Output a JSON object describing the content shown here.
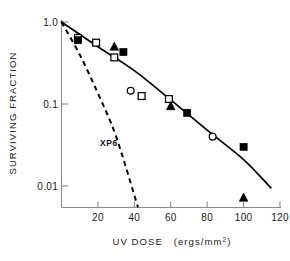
{
  "chart_data": {
    "type": "scatter",
    "title": "",
    "subtitle": "",
    "xlabel": "UV DOSE (ergs/mm2)",
    "xlabel_main": "UV DOSE",
    "xlabel_units_pre": "(ergs/mm",
    "xlabel_units_sup": "2",
    "xlabel_units_post": ")",
    "ylabel": "SURVIVING FRACTION",
    "xlim": [
      0,
      125
    ],
    "ylim": [
      0.005,
      1.0
    ],
    "yscale": "log",
    "xscale": "linear",
    "grid": false,
    "legend": "none",
    "xticks": [
      20,
      40,
      60,
      80,
      100,
      120
    ],
    "xticklabels": [
      "20",
      "40",
      "60",
      "80",
      "100",
      "120"
    ],
    "yticks": [
      1.0,
      0.1,
      0.01
    ],
    "yticklabels": [
      "1.0",
      "0.1",
      "0.01"
    ],
    "annotations": [
      {
        "text": "XP6",
        "x": 26,
        "y": 0.031,
        "note": "label for dashed XP6 survival curve"
      }
    ],
    "series": [
      {
        "name": "open-square",
        "marker": "open square",
        "points": [
          {
            "x": 9,
            "y": 0.64
          },
          {
            "x": 19,
            "y": 0.56
          },
          {
            "x": 29,
            "y": 0.37
          },
          {
            "x": 44,
            "y": 0.125
          },
          {
            "x": 59,
            "y": 0.115
          }
        ]
      },
      {
        "name": "filled-square",
        "marker": "filled square",
        "points": [
          {
            "x": 9,
            "y": 0.6
          },
          {
            "x": 34,
            "y": 0.43
          },
          {
            "x": 69,
            "y": 0.078
          },
          {
            "x": 100,
            "y": 0.03
          }
        ]
      },
      {
        "name": "filled-triangle",
        "marker": "filled triangle",
        "points": [
          {
            "x": 29,
            "y": 0.5
          },
          {
            "x": 60,
            "y": 0.094
          },
          {
            "x": 100,
            "y": 0.0072
          }
        ]
      },
      {
        "name": "open-circle",
        "marker": "open circle",
        "points": [
          {
            "x": 38,
            "y": 0.145
          },
          {
            "x": 83,
            "y": 0.04
          }
        ]
      }
    ],
    "curves": [
      {
        "name": "normal-fit",
        "style": "solid",
        "description": "solid fitted survival curve through the plotted data",
        "points": [
          {
            "x": 0,
            "y": 1.0
          },
          {
            "x": 20,
            "y": 0.5
          },
          {
            "x": 40,
            "y": 0.255
          },
          {
            "x": 60,
            "y": 0.112
          },
          {
            "x": 80,
            "y": 0.048
          },
          {
            "x": 100,
            "y": 0.021
          },
          {
            "x": 115,
            "y": 0.0095
          }
        ]
      },
      {
        "name": "XP6",
        "style": "dashed",
        "description": "dashed steeper survival curve labelled XP6",
        "points": [
          {
            "x": 0,
            "y": 1.0
          },
          {
            "x": 10,
            "y": 0.4
          },
          {
            "x": 20,
            "y": 0.135
          },
          {
            "x": 30,
            "y": 0.04
          },
          {
            "x": 42,
            "y": 0.0055
          }
        ]
      }
    ]
  }
}
